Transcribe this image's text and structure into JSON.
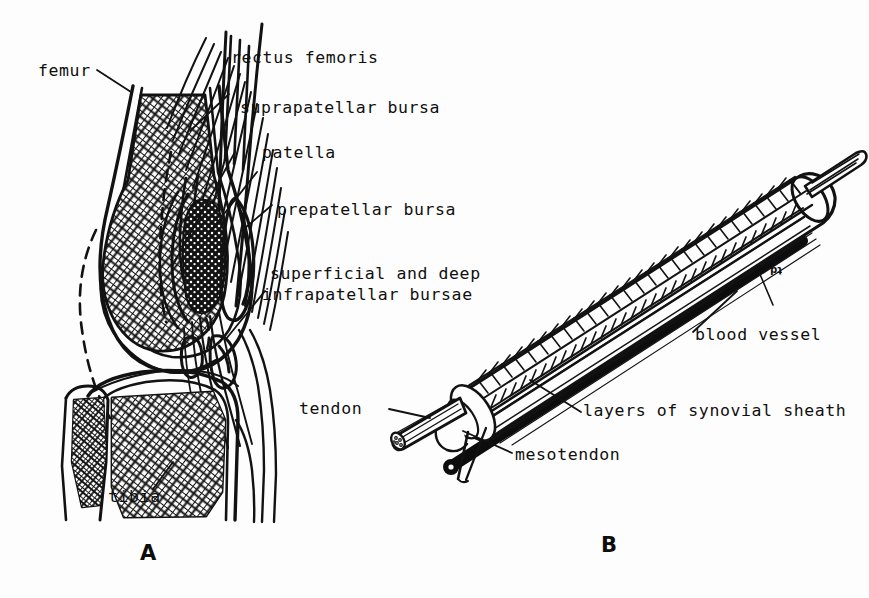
{
  "figure": {
    "background_color": "#fdfdfd",
    "ink_color": "#111111",
    "panels": [
      {
        "letter": "A",
        "caption_subject": "sagittal section of the knee joint showing bursae"
      },
      {
        "letter": "B",
        "caption_subject": "tendon enclosed in a synovial sheath"
      }
    ]
  },
  "panel_a": {
    "letter": "A",
    "labels": [
      {
        "key": "femur",
        "text": "femur"
      },
      {
        "key": "rectus_femoris",
        "text": "rectus femoris"
      },
      {
        "key": "suprapatellar_bursa",
        "text": "suprapatellar bursa"
      },
      {
        "key": "patella",
        "text": "patella"
      },
      {
        "key": "prepatellar_bursa",
        "text": "prepatellar bursa"
      },
      {
        "key": "infrapatellar_l1",
        "text": "superficial and deep"
      },
      {
        "key": "infrapatellar_l2",
        "text": "infrapatellar bursae"
      },
      {
        "key": "tibia",
        "text": "tibia"
      }
    ]
  },
  "panel_b": {
    "letter": "B",
    "artist_mark": "td",
    "labels": [
      {
        "key": "blood_vessel",
        "text": "blood vessel"
      },
      {
        "key": "synovial_sheath",
        "text": "layers of synovial sheath"
      },
      {
        "key": "mesotendon",
        "text": "mesotendon"
      },
      {
        "key": "tendon",
        "text": "tendon"
      }
    ]
  }
}
